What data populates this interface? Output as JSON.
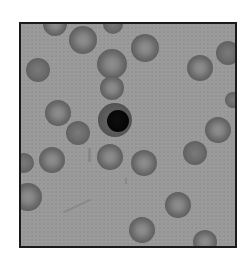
{
  "image": {
    "description": "Grayscale light-microscopy field of red blood cells with a single nucleated cell near the center",
    "frame": {
      "border_color": "#1a1a1a",
      "background_color": "#9a9a9a"
    },
    "nucleated_cell": {
      "x": 115,
      "y": 120,
      "r": 17,
      "nucleus": {
        "x": 118,
        "y": 121,
        "r": 11,
        "color": "#080808"
      }
    },
    "cells": [
      {
        "x": 55,
        "y": 24,
        "r": 12,
        "type": "ring"
      },
      {
        "x": 83,
        "y": 40,
        "r": 14,
        "type": "ring"
      },
      {
        "x": 113,
        "y": 24,
        "r": 10,
        "type": "flat"
      },
      {
        "x": 145,
        "y": 48,
        "r": 14,
        "type": "ring"
      },
      {
        "x": 38,
        "y": 70,
        "r": 12,
        "type": "flat"
      },
      {
        "x": 112,
        "y": 64,
        "r": 15,
        "type": "ring"
      },
      {
        "x": 112,
        "y": 88,
        "r": 12,
        "type": "ring"
      },
      {
        "x": 200,
        "y": 68,
        "r": 13,
        "type": "ring"
      },
      {
        "x": 228,
        "y": 53,
        "r": 12,
        "type": "flat"
      },
      {
        "x": 58,
        "y": 113,
        "r": 13,
        "type": "ring"
      },
      {
        "x": 78,
        "y": 133,
        "r": 12,
        "type": "flat"
      },
      {
        "x": 233,
        "y": 100,
        "r": 8,
        "type": "flat"
      },
      {
        "x": 218,
        "y": 130,
        "r": 13,
        "type": "ring"
      },
      {
        "x": 24,
        "y": 163,
        "r": 10,
        "type": "flat"
      },
      {
        "x": 52,
        "y": 160,
        "r": 13,
        "type": "ring"
      },
      {
        "x": 110,
        "y": 157,
        "r": 13,
        "type": "ring"
      },
      {
        "x": 144,
        "y": 163,
        "r": 13,
        "type": "ring"
      },
      {
        "x": 195,
        "y": 153,
        "r": 12,
        "type": "flat"
      },
      {
        "x": 28,
        "y": 197,
        "r": 14,
        "type": "ring"
      },
      {
        "x": 178,
        "y": 205,
        "r": 13,
        "type": "ring"
      },
      {
        "x": 142,
        "y": 230,
        "r": 13,
        "type": "ring"
      },
      {
        "x": 205,
        "y": 242,
        "r": 12,
        "type": "ring"
      }
    ],
    "debris": [
      {
        "x": 88,
        "y": 148,
        "w": 3,
        "h": 14
      },
      {
        "x": 62,
        "y": 205,
        "w": 30,
        "h": 2,
        "rotate": -25
      },
      {
        "x": 125,
        "y": 178,
        "w": 2,
        "h": 6
      }
    ]
  }
}
